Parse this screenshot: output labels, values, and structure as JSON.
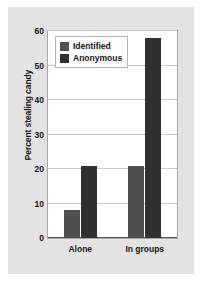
{
  "chart_data": {
    "type": "bar",
    "title": "",
    "xlabel": "",
    "ylabel": "Percent stealing candy",
    "categories": [
      "Alone",
      "In groups"
    ],
    "series": [
      {
        "name": "Identified",
        "values": [
          8,
          21
        ],
        "color": "#4f4f4f"
      },
      {
        "name": "Anonymous",
        "values": [
          21,
          58
        ],
        "color": "#303030"
      }
    ],
    "ylim": [
      0,
      60
    ],
    "yticks": [
      0,
      10,
      20,
      30,
      40,
      50,
      60
    ],
    "ytick_labels": [
      "0",
      "10",
      "20",
      "30",
      "40",
      "50",
      "60"
    ],
    "grid": true,
    "legend_position": "top-left-inside"
  },
  "legend": {
    "entries": [
      {
        "label": "Identified",
        "swatch": "identified-swatch"
      },
      {
        "label": "Anonymous",
        "swatch": "anonymous-swatch"
      }
    ]
  },
  "axes": {
    "y_title": "Percent stealing candy",
    "y_labels": [
      "60",
      "50",
      "40",
      "30",
      "20",
      "10",
      "0"
    ],
    "x_labels": [
      "Alone",
      "In groups"
    ]
  },
  "colors": {
    "panel_background": "#e3e3e3",
    "plot_background": "#ffffff",
    "gridline": "#c9c9c9",
    "axis": "#5a5a5a",
    "identified": "#4f4f4f",
    "anonymous": "#303030",
    "text": "#151515"
  }
}
